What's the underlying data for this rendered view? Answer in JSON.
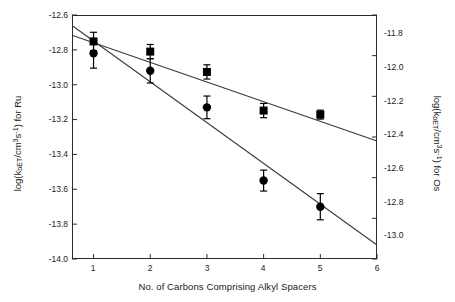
{
  "chart_data": {
    "type": "scatter",
    "title": "",
    "xlabel": "No. of Carbons Comprising Alkyl Spacers",
    "ylabel_left": "log(kbET/cm3s-1) for Ru",
    "ylabel_right": "log(kbET/cm3s-1) for Os",
    "x": [
      1,
      2,
      3,
      4,
      5
    ],
    "xlim": [
      0.62,
      6.0
    ],
    "xticks": [
      1,
      2,
      3,
      4,
      5,
      6
    ],
    "xticklabels": [
      "1",
      "2",
      "3",
      "4",
      "5",
      "6"
    ],
    "ylim_left": [
      -14.0,
      -12.6
    ],
    "yticks_left": [
      -12.6,
      -12.8,
      -13.0,
      -13.2,
      -13.4,
      -13.6,
      -13.8,
      -14.0
    ],
    "yticklabels_left": [
      "-12.6",
      "-12.8",
      "-13.0",
      "-13.2",
      "-13.4",
      "-13.6",
      "-13.8",
      "-14.0"
    ],
    "ylim_right": [
      -13.0,
      -11.8
    ],
    "yticks_right": [
      -11.8,
      -12.0,
      -12.2,
      -12.4,
      -12.6,
      -12.8,
      -13.0
    ],
    "yticklabels_right": [
      "-11.8",
      "-12.0",
      "-12.2",
      "-12.4",
      "-12.6",
      "-12.8",
      "-13.0"
    ],
    "grid": false,
    "legend": "none",
    "series": [
      {
        "name": "Os (squares, right axis)",
        "marker": "square",
        "axis": "right",
        "color": "#000000",
        "values": [
          -11.93,
          -11.98,
          -12.08,
          -12.27,
          -12.29
        ],
        "yerr": [
          0.045,
          0.035,
          0.035,
          0.035,
          0.022
        ],
        "fit_line": {
          "x": [
            0.62,
            6.0
          ],
          "y": [
            -11.9,
            -12.42
          ]
        }
      },
      {
        "name": "Ru (circles, left axis)",
        "marker": "circle",
        "axis": "left",
        "color": "#000000",
        "values": [
          -12.82,
          -12.92,
          -13.13,
          -13.55,
          -13.7
        ],
        "yerr": [
          0.085,
          0.07,
          0.065,
          0.06,
          0.075
        ],
        "fit_line": {
          "x": [
            0.62,
            6.0
          ],
          "y": [
            -12.66,
            -13.92
          ]
        }
      }
    ]
  },
  "axes": {
    "x_title": "No. of Carbons Comprising Alkyl Spacers",
    "y_left": {
      "prefix": "log(k",
      "sub1": "bET",
      "mid": "/cm",
      "sup1": "3",
      "mid2": "s",
      "sup2": "-1",
      "suffix": ") for Ru"
    },
    "y_right": {
      "prefix": "log(k",
      "sub1": "bET",
      "mid": "/cm",
      "sup1": "3",
      "mid2": "s",
      "sup2": "-1",
      "suffix": ") for Os"
    }
  },
  "colors": {
    "axis": "#2b2b2b",
    "marker": "#000000",
    "line": "#3a3a3a",
    "background": "#ffffff"
  }
}
